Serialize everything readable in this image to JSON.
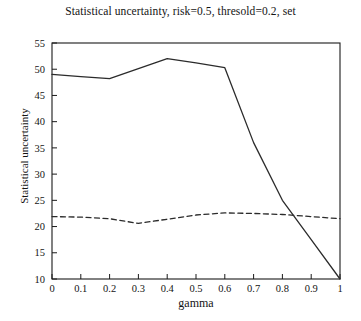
{
  "chart_data": {
    "type": "line",
    "title": "Statistical uncertainty, risk=0.5, thresold=0.2, set",
    "xlabel": "gamma",
    "ylabel": "Statistical uncertainty",
    "xlim": [
      0,
      1
    ],
    "ylim": [
      10,
      55
    ],
    "xticks": [
      0,
      0.1,
      0.2,
      0.3,
      0.4,
      0.5,
      0.6,
      0.7,
      0.8,
      0.9,
      1
    ],
    "xticklabels": [
      "0",
      "0.1",
      "0.2",
      "0.3",
      "0.4",
      "0.5",
      "0.6",
      "0.7",
      "0.8",
      "0.9",
      "1"
    ],
    "yticks": [
      10,
      15,
      20,
      25,
      30,
      35,
      40,
      45,
      50,
      55
    ],
    "yticklabels": [
      "10",
      "15",
      "20",
      "25",
      "30",
      "35",
      "40",
      "45",
      "50",
      "55"
    ],
    "grid": false,
    "legend": null,
    "series": [
      {
        "name": "solid",
        "linestyle": "solid",
        "color": "#2b2b2b",
        "x": [
          0,
          0.1,
          0.2,
          0.3,
          0.4,
          0.5,
          0.6,
          0.7,
          0.8,
          0.9,
          1
        ],
        "values": [
          49.0,
          48.6,
          48.2,
          50.1,
          52.0,
          51.2,
          50.3,
          36.0,
          25.0,
          17.5,
          10.0
        ]
      },
      {
        "name": "dashed",
        "linestyle": "dashed",
        "color": "#2b2b2b",
        "x": [
          0,
          0.1,
          0.2,
          0.3,
          0.4,
          0.5,
          0.6,
          0.7,
          0.8,
          0.9,
          1
        ],
        "values": [
          21.9,
          21.8,
          21.5,
          20.6,
          21.4,
          22.2,
          22.6,
          22.5,
          22.3,
          21.9,
          21.5
        ]
      }
    ]
  },
  "figure": {
    "title": "Statistical uncertainty, risk=0.5, thresold=0.2, set",
    "xlabel": "gamma",
    "ylabel": "Statistical uncertainty"
  }
}
